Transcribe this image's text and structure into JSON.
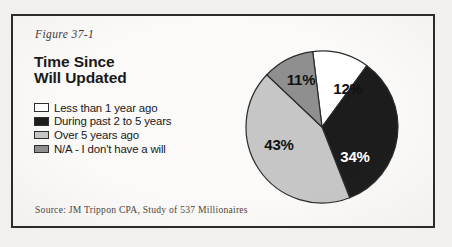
{
  "figure": {
    "label": "Figure 37-1",
    "title_line1": "Time Since",
    "title_line2": "Will Updated",
    "source": "Source: JM Trippon CPA, Study of 537 Millionaires"
  },
  "colors": {
    "white_slice": "#ffffff",
    "black_slice": "#1c1c1c",
    "light_gray_slice": "#c6c6c6",
    "medium_gray_slice": "#8f8f8f",
    "outline": "#2b2b2b",
    "card_background": "#fbfaf8",
    "page_background": "#f2f0ee",
    "text": "#171717"
  },
  "legend": {
    "items": [
      {
        "label": "Less than 1 year ago",
        "swatch": "#ffffff"
      },
      {
        "label": "During past 2 to 5 years",
        "swatch": "#1c1c1c"
      },
      {
        "label": "Over 5 years ago",
        "swatch": "#c6c6c6"
      },
      {
        "label": "N/A - I don't have a will",
        "swatch": "#8f8f8f"
      }
    ]
  },
  "chart_data": {
    "type": "pie",
    "title": "Time Since Will Updated",
    "subtitle": "",
    "xlabel": "",
    "ylabel": "",
    "grid": false,
    "legend_position": "left",
    "total_respondents": 537,
    "source": "Source: JM Trippon CPA, Study of 537 Millionaires",
    "categories": [
      "Less than 1 year ago",
      "During past 2 to 5 years",
      "Over 5 years ago",
      "N/A - I don't have a will"
    ],
    "values": [
      12,
      34,
      43,
      11
    ],
    "value_labels": [
      "12%",
      "34%",
      "43%",
      "11%"
    ],
    "slice_colors": [
      "#ffffff",
      "#1c1c1c",
      "#c6c6c6",
      "#8f8f8f"
    ],
    "label_colors": [
      "#111111",
      "#ffffff",
      "#111111",
      "#111111"
    ],
    "units": "percent",
    "start_angle_deg": -7,
    "direction": "clockwise",
    "slices": [
      {
        "category": "Less than 1 year ago",
        "value": 12,
        "label": "12%",
        "color": "#ffffff",
        "label_color": "#111111",
        "label_x": 123,
        "label_y": 60
      },
      {
        "category": "During past 2 to 5 years",
        "value": 34,
        "label": "34%",
        "color": "#1c1c1c",
        "label_color": "#ffffff",
        "label_x": 130,
        "label_y": 128
      },
      {
        "category": "Over 5 years ago",
        "value": 43,
        "label": "43%",
        "color": "#c6c6c6",
        "label_color": "#111111",
        "label_x": 54,
        "label_y": 116
      },
      {
        "category": "N/A - I don't have a will",
        "value": 11,
        "label": "11%",
        "color": "#8f8f8f",
        "label_color": "#111111",
        "label_x": 76,
        "label_y": 51
      }
    ]
  }
}
